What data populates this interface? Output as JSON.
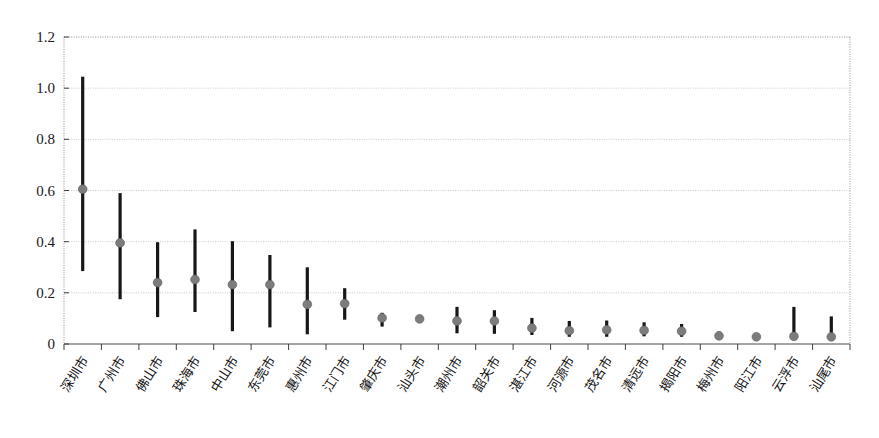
{
  "chart_data": {
    "type": "scatter",
    "title": "",
    "subtitle": "",
    "xlabel": "",
    "ylabel": "",
    "ylim": [
      0,
      1.2
    ],
    "grid": true,
    "legend": "none",
    "ytick_labels": [
      "0",
      "0.2",
      "0.4",
      "0.6",
      "0.8",
      "1.0",
      "1.2"
    ],
    "ytick_values": [
      0,
      0.2,
      0.4,
      0.6,
      0.8,
      1.0,
      1.2
    ],
    "categories": [
      "深圳市",
      "广州市",
      "佛山市",
      "珠海市",
      "中山市",
      "东莞市",
      "惠州市",
      "江门市",
      "肇庆市",
      "汕头市",
      "潮州市",
      "韶关市",
      "湛江市",
      "河源市",
      "茂名市",
      "清远市",
      "揭阳市",
      "梅州市",
      "阳江市",
      "云浮市",
      "汕尾市"
    ],
    "series": [
      {
        "name": "point estimate",
        "values": [
          0.605,
          0.395,
          0.24,
          0.252,
          0.232,
          0.232,
          0.155,
          0.158,
          0.102,
          0.098,
          0.09,
          0.09,
          0.062,
          0.052,
          0.055,
          0.053,
          0.05,
          0.032,
          0.028,
          0.03,
          0.028
        ]
      },
      {
        "name": "lower bound",
        "values": [
          0.285,
          0.175,
          0.105,
          0.125,
          0.05,
          0.065,
          0.038,
          0.095,
          0.068,
          0.085,
          0.042,
          0.04,
          0.035,
          0.028,
          0.028,
          0.03,
          0.028,
          0.02,
          0.018,
          0.022,
          0.02
        ]
      },
      {
        "name": "upper bound",
        "values": [
          1.045,
          0.59,
          0.398,
          0.448,
          0.402,
          0.348,
          0.3,
          0.218,
          0.122,
          0.11,
          0.145,
          0.132,
          0.102,
          0.09,
          0.092,
          0.085,
          0.078,
          0.048,
          0.04,
          0.145,
          0.108
        ]
      }
    ]
  },
  "figure": {
    "background_color": "#ffffff",
    "marker_color": "#7c7c7c",
    "whisker_color": "#171717",
    "grid_color": "#c9c9c9",
    "axis_color": "#4a4a4a"
  }
}
